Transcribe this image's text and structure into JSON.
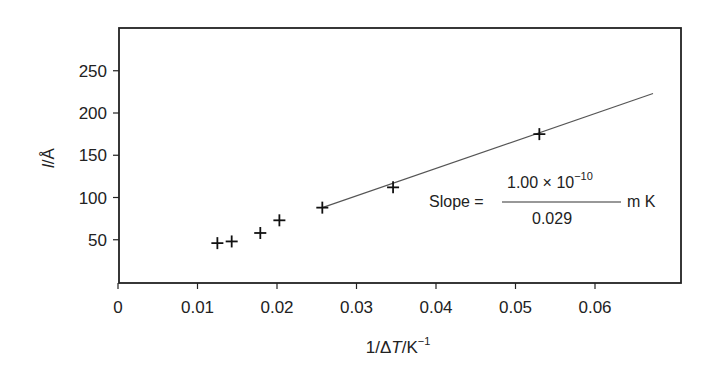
{
  "chart_data": {
    "type": "scatter",
    "title": "",
    "xlabel": "1/ΔT/K⁻¹",
    "ylabel": "l/Å",
    "xlim": [
      0,
      0.07
    ],
    "ylim": [
      0,
      290
    ],
    "x_ticks": [
      0,
      0.01,
      0.02,
      0.03,
      0.04,
      0.05,
      0.06
    ],
    "x_tick_labels": [
      "0",
      "0.01",
      "0.02",
      "0.03",
      "0.04",
      "0.05",
      "0.06"
    ],
    "y_ticks": [
      50,
      100,
      150,
      200,
      250
    ],
    "y_tick_labels": [
      "50",
      "100",
      "150",
      "200",
      "250"
    ],
    "grid": false,
    "legend": null,
    "series": [
      {
        "name": "data",
        "marker": "+",
        "x": [
          0.0125,
          0.0143,
          0.0179,
          0.0203,
          0.0257,
          0.0346,
          0.053
        ],
        "y": [
          46,
          48,
          58,
          73,
          88,
          112,
          175
        ]
      },
      {
        "name": "fit line",
        "type": "line",
        "x": [
          0.0257,
          0.0673
        ],
        "y": [
          88,
          223
        ]
      }
    ],
    "annotations": [
      {
        "text": "Slope = (1.00 × 10⁻¹⁰) / 0.029 m K",
        "prefix": "Slope =",
        "numerator": "1.00 × 10",
        "exponent": "−10",
        "denominator": "0.029",
        "unit": "m K"
      }
    ]
  },
  "labels": {
    "xlabel_main": "1/Δ",
    "xlabel_T": "T",
    "xlabel_unit": "/K",
    "xlabel_sup": "−1",
    "ylabel_l": "l",
    "ylabel_unit": "/Å",
    "slope_prefix": "Slope =",
    "slope_numerator": "1.00 × 10",
    "slope_exponent": "−10",
    "slope_denominator": "0.029",
    "slope_unit": "m K"
  }
}
